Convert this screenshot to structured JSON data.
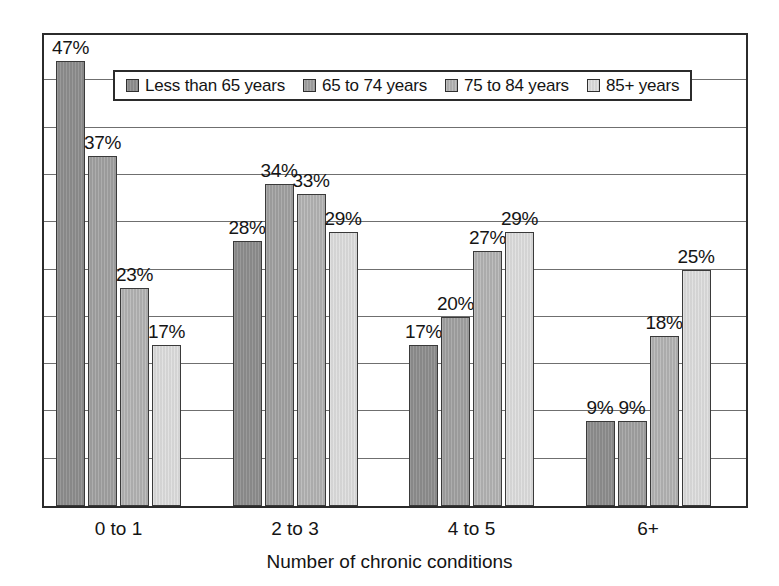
{
  "chart_data": {
    "type": "bar",
    "title": "",
    "subtitle": "",
    "xlabel": "Number of chronic conditions",
    "ylabel": "",
    "categories": [
      "0 to 1",
      "2 to 3",
      "4 to 5",
      "6+"
    ],
    "series": [
      {
        "name": "Less than 65 years",
        "color": "#8f8f8f",
        "values": [
          47,
          28,
          17,
          9
        ],
        "labels": [
          "47%",
          "28%",
          "17%",
          "9%"
        ]
      },
      {
        "name": "65 to 74 years",
        "color": "#a2a2a2",
        "values": [
          37,
          34,
          20,
          9
        ],
        "labels": [
          "37%",
          "34%",
          "20%",
          "9%"
        ]
      },
      {
        "name": "75 to 84 years",
        "color": "#b4b4b4",
        "values": [
          23,
          33,
          27,
          18
        ],
        "labels": [
          "23%",
          "33%",
          "27%",
          "18%"
        ]
      },
      {
        "name": "85+ years",
        "color": "#dcdcdc",
        "values": [
          17,
          29,
          29,
          25
        ],
        "labels": [
          "17%",
          "29%",
          "29%",
          "25%"
        ]
      }
    ],
    "ylim": [
      0,
      50
    ],
    "y_tick_labels": [],
    "gridlines": {
      "horizontal": true,
      "vertical": false,
      "count": 9,
      "interval": 5
    },
    "value_label_suffix": "%",
    "legend": {
      "position": "top-inside",
      "bordered": true
    },
    "frame": {
      "bordered": true
    }
  },
  "legend": {
    "items": [
      {
        "label": "Less than 65 years"
      },
      {
        "label": "65 to 74 years"
      },
      {
        "label": "75 to 84 years"
      },
      {
        "label": "85+ years"
      }
    ]
  },
  "axis": {
    "x_title": "Number of chronic conditions",
    "x_ticks": [
      "0 to 1",
      "2 to 3",
      "4 to 5",
      "6+"
    ]
  },
  "colors": {
    "series_1": "#8f8f8f",
    "series_2": "#a2a2a2",
    "series_3": "#b4b4b4",
    "series_4": "#dcdcdc",
    "frame": "#2b2b2b",
    "gridline": "#6f6f6f",
    "text": "#141414",
    "background": "#ffffff"
  }
}
